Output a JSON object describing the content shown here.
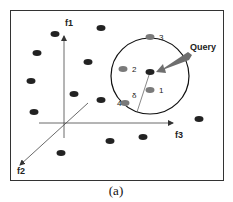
{
  "figure": {
    "caption": "(a)",
    "axes": {
      "f1": "f1",
      "f2": "f2",
      "f3": "f3"
    },
    "query_label": "Query",
    "radius_label": "δ",
    "neighbor_labels": [
      "1",
      "2",
      "3",
      "4"
    ],
    "colors": {
      "frame": "#333333",
      "dark_point": "#222222",
      "neighbor_point": "#7a7a7a",
      "arrow": "#6e6e6e",
      "axis": "#444444"
    },
    "dark_points": [
      [
        55,
        34
      ],
      [
        101,
        28
      ],
      [
        37,
        53
      ],
      [
        88,
        62
      ],
      [
        31,
        81
      ],
      [
        74,
        94
      ],
      [
        101,
        100
      ],
      [
        34,
        112
      ],
      [
        199,
        119
      ],
      [
        143,
        137
      ],
      [
        110,
        141
      ],
      [
        61,
        153
      ]
    ],
    "neighbor_points": [
      {
        "label": "3",
        "x": 150,
        "y": 37
      },
      {
        "label": "2",
        "x": 123,
        "y": 69
      },
      {
        "label": "1",
        "x": 150,
        "y": 90
      },
      {
        "label": "4",
        "x": 125,
        "y": 103
      }
    ],
    "query_point": [
      150,
      72
    ]
  }
}
